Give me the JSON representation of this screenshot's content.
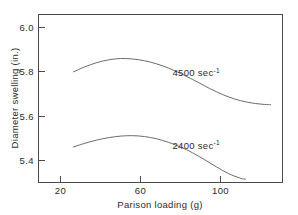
{
  "chart_data": {
    "type": "line",
    "title": "",
    "xlabel": "Parison loading (g)",
    "ylabel": "Diameter swelling (in.)",
    "xlim": [
      11,
      131
    ],
    "ylim": [
      5.31,
      6.06
    ],
    "xticks": [
      20,
      60,
      100
    ],
    "xtick_labels": [
      "20",
      "60",
      "100"
    ],
    "yticks": [
      5.4,
      5.6,
      5.8,
      6.0
    ],
    "ytick_labels": [
      "5.4",
      "5.6",
      "5.8",
      "6.0"
    ],
    "grid": false,
    "legend": "inline-annotations",
    "series": [
      {
        "name": "4500 sec-1",
        "label": "4500 sec",
        "label_exponent": "-1",
        "color": "#5b5b5b",
        "x": [
          26.5,
          32,
          38,
          44,
          50,
          56,
          62,
          68,
          74,
          80,
          86,
          92,
          98,
          104,
          110,
          116,
          122,
          125
        ],
        "y": [
          5.8,
          5.822,
          5.841,
          5.854,
          5.86,
          5.858,
          5.85,
          5.836,
          5.817,
          5.793,
          5.766,
          5.737,
          5.71,
          5.687,
          5.67,
          5.659,
          5.653,
          5.652
        ]
      },
      {
        "name": "2400 sec-1",
        "label": "2400 sec",
        "label_exponent": "-1",
        "color": "#5b5b5b",
        "x": [
          26.5,
          32,
          38,
          44,
          50,
          56,
          62,
          68,
          74,
          80,
          86,
          92,
          98,
          104,
          110,
          112.5
        ],
        "y": [
          5.461,
          5.477,
          5.492,
          5.503,
          5.51,
          5.512,
          5.508,
          5.498,
          5.482,
          5.461,
          5.435,
          5.404,
          5.371,
          5.341,
          5.32,
          5.316
        ]
      }
    ],
    "annotations": [
      {
        "text": "4500 sec",
        "sup": "-1",
        "x": 76,
        "y": 5.795
      },
      {
        "text": "2400 sec",
        "sup": "-1",
        "x": 76,
        "y": 5.468
      }
    ]
  },
  "axes": {
    "y_title": "Diameter swelling (in.)",
    "x_title": "Parison loading (g)"
  }
}
